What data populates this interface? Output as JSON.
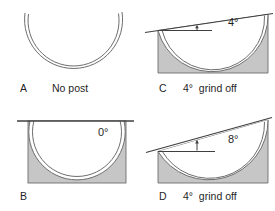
{
  "figure": {
    "panels": {
      "a": {
        "letter": "A",
        "caption": "No post"
      },
      "b": {
        "letter": "B",
        "angle_label": "0°"
      },
      "c": {
        "letter": "C",
        "caption": "4°  grind off",
        "angle_label": "4°"
      },
      "d": {
        "letter": "D",
        "caption": "4°  grind off",
        "angle_label": "8°"
      }
    },
    "colors": {
      "block_fill": "#c6c6c6",
      "line": "#3f3f3f",
      "rim": "#6e6e6e",
      "text": "#1f1f1f",
      "cup_fill": "#ffffff",
      "background": "#ffffff"
    }
  }
}
